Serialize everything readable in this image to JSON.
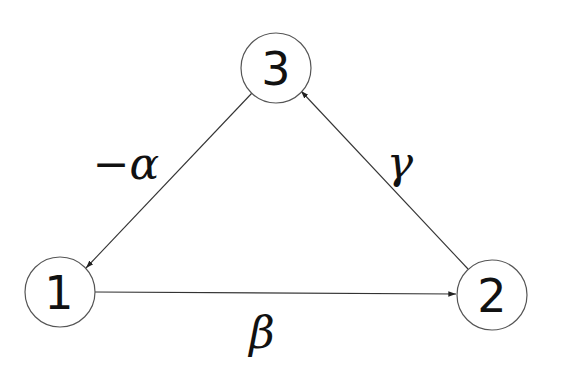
{
  "diagram": {
    "type": "directed-graph",
    "nodes": [
      {
        "id": "1",
        "label": "1",
        "cx": 60,
        "cy": 292,
        "r": 35
      },
      {
        "id": "2",
        "label": "2",
        "cx": 492,
        "cy": 295,
        "r": 35
      },
      {
        "id": "3",
        "label": "3",
        "cx": 276,
        "cy": 68,
        "r": 35
      }
    ],
    "edges": [
      {
        "from": "3",
        "to": "1",
        "label": "−α",
        "label_x": 125,
        "label_y": 163
      },
      {
        "from": "1",
        "to": "2",
        "label": "β",
        "label_x": 260,
        "label_y": 330
      },
      {
        "from": "2",
        "to": "3",
        "label": "γ",
        "label_x": 400,
        "label_y": 162
      }
    ],
    "colors": {
      "stroke": "#333333",
      "text": "#111111",
      "background": "#ffffff"
    }
  }
}
